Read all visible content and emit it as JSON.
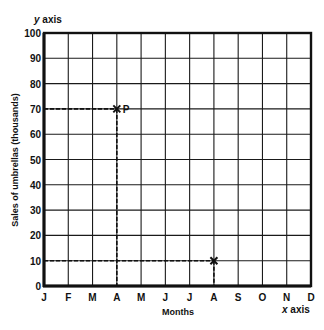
{
  "chart_data": {
    "type": "scatter",
    "title": "",
    "xlabel": "Months",
    "ylabel": "Sales of umbrellas (thousands)",
    "x_axis_tag": "x axis",
    "y_axis_tag": "y axis",
    "categories": [
      "J",
      "F",
      "M",
      "A",
      "M",
      "J",
      "J",
      "A",
      "S",
      "O",
      "N",
      "D"
    ],
    "yticks": [
      0,
      10,
      20,
      30,
      40,
      50,
      60,
      70,
      80,
      90,
      100
    ],
    "ylim": [
      0,
      100
    ],
    "grid": true,
    "points": [
      {
        "x": "A",
        "x_index": 3,
        "y": 70,
        "label": "P",
        "marker": "x",
        "guide_lines": "dashed"
      },
      {
        "x": "A",
        "x_index": 7,
        "y": 10,
        "label": "",
        "marker": "x",
        "guide_lines": "dashed"
      }
    ]
  },
  "layout": {
    "plot_left": 44,
    "plot_right": 311,
    "plot_top": 33,
    "plot_bottom": 286,
    "ink_color": "#111111",
    "background": "#ffffff"
  }
}
